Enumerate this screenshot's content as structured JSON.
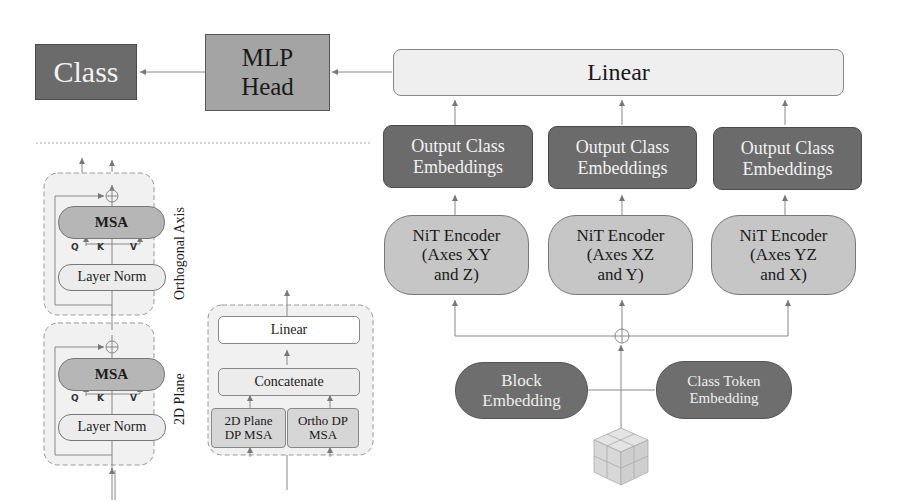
{
  "top_row": {
    "class_label": "Class",
    "mlp_head": [
      "MLP",
      "Head"
    ],
    "linear": "Linear"
  },
  "branches": [
    {
      "output": [
        "Output Class",
        "Embeddings"
      ],
      "encoder": [
        "NiT Encoder",
        "(Axes XY",
        "and Z)"
      ]
    },
    {
      "output": [
        "Output Class",
        "Embeddings"
      ],
      "encoder": [
        "NiT Encoder",
        "(Axes XZ",
        "and Y)"
      ]
    },
    {
      "output": [
        "Output Class",
        "Embeddings"
      ],
      "encoder": [
        "NiT Encoder",
        "(Axes YZ",
        "and X)"
      ]
    }
  ],
  "embeddings": {
    "block": [
      "Block",
      "Embedding"
    ],
    "class_token": [
      "Class Token",
      "Embedding"
    ],
    "sum_symbol": "⊕",
    "input": "3d-cube-volume"
  },
  "encoder_detail": {
    "orthogonal": {
      "label": "Orthogonal Axis",
      "msa": "MSA",
      "norm": "Layer Norm",
      "q": "Q",
      "k": "K",
      "v": "V",
      "sum_symbol": "⊕"
    },
    "plane": {
      "label": "2D Plane",
      "msa": "MSA",
      "norm": "Layer Norm",
      "q": "Q",
      "k": "K",
      "v": "V",
      "sum_symbol": "⊕"
    }
  },
  "dp_msa_detail": {
    "linear": "Linear",
    "concat": "Concatenate",
    "plane_dp": [
      "2D Plane",
      "DP MSA"
    ],
    "ortho_dp": [
      "Ortho DP",
      "MSA"
    ]
  }
}
